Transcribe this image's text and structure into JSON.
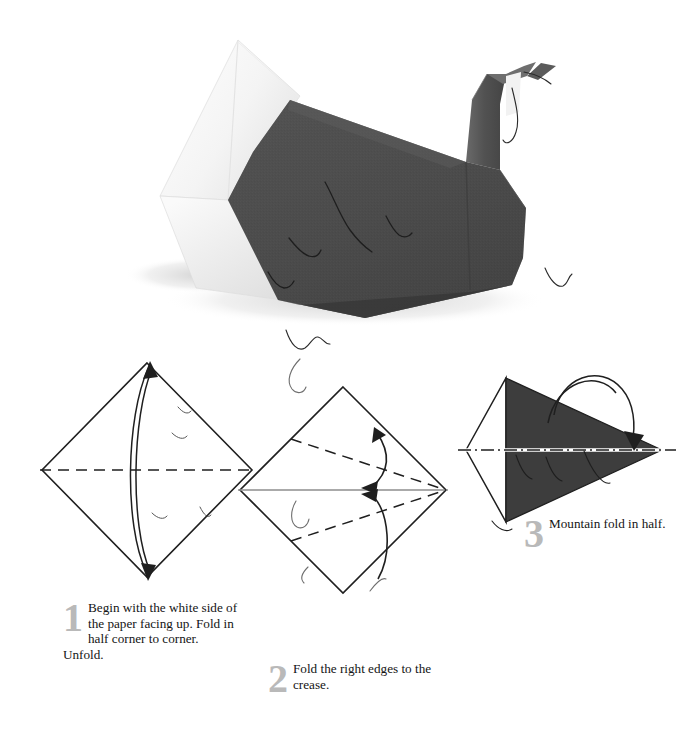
{
  "page": {
    "background_color": "#ffffff"
  },
  "photo": {
    "name": "finished-origami-swan-photo",
    "description": "Photograph of a completed origami swan folded from paper that is dark gray on one side and white on the other.",
    "model_name": "Swan",
    "body_color": "#4d4d4d",
    "body_shadow_color": "#3a3a3a",
    "wing_color": "#f7f7f7",
    "wing_shade_color": "#e2e2e2",
    "neck_color": "#545454",
    "head_highlight_color": "#6b6b6b",
    "drop_shadow_color": "#d8d8d8"
  },
  "steps": [
    {
      "number": "1",
      "text": "Begin with the white side of the paper facing up. Fold in half corner to corner. Unfold.",
      "diagram": {
        "name": "diagram-step-1",
        "shape": "square-diamond",
        "fill": "#ffffff",
        "stroke": "#1f1f1f",
        "fold_line": "valley-horizontal-dashed",
        "fold_line_style": "dashed",
        "arrow": "double-headed-curved-vertical"
      }
    },
    {
      "number": "2",
      "text": "Fold the right edges to the crease.",
      "diagram": {
        "name": "diagram-step-2",
        "shape": "square-diamond",
        "fill": "#ffffff",
        "stroke": "#1f1f1f",
        "crease_line": "horizontal-thin-gray",
        "crease_color": "#8e8e8e",
        "fold_line": "two-valley-dashed-to-center",
        "fold_line_style": "dashed",
        "arrow": "two-curved-arrows-to-center"
      }
    },
    {
      "number": "3",
      "text": "Mountain fold in half.",
      "diagram": {
        "name": "diagram-step-3",
        "shape": "kite",
        "fill_dark": "#3d3d3d",
        "fill_light": "#ffffff",
        "stroke": "#1f1f1f",
        "fold_line": "mountain-horizontal-dash-dot",
        "fold_line_style": "dash-dot",
        "arrow": "curved-arrow-over-top"
      }
    }
  ],
  "colors": {
    "step_number": "#b9b9b9",
    "caption_text": "#141414",
    "diagram_stroke": "#1f1f1f",
    "diagram_dark_fill": "#3d3d3d",
    "crease_gray": "#8e8e8e"
  }
}
